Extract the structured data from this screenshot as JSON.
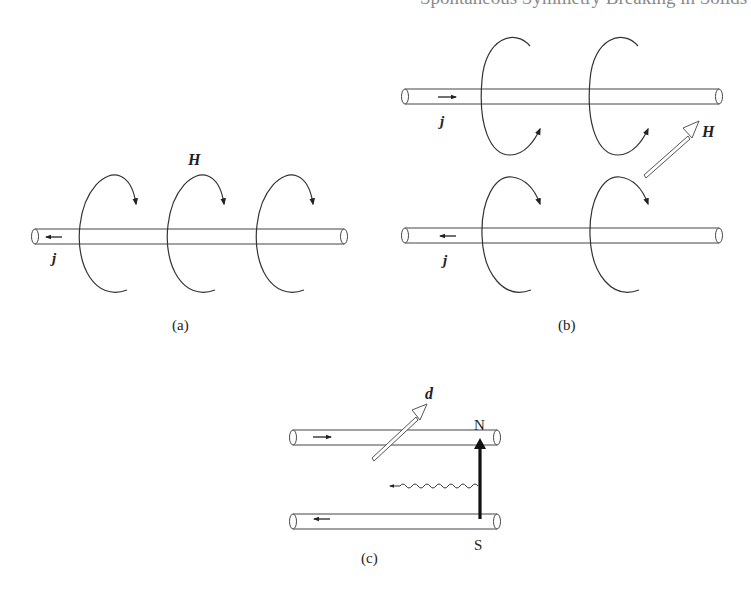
{
  "header": {
    "clipped_text": "Spontaneous Symmetry Breaking in Solids"
  },
  "panels": {
    "a": {
      "caption": "(a)",
      "current_label": "j",
      "field_label": "H",
      "current_direction": "left"
    },
    "b": {
      "caption": "(b)",
      "top_current_label": "j",
      "bottom_current_label": "j",
      "field_label": "H",
      "top_current_direction": "right",
      "bottom_current_direction": "left"
    },
    "c": {
      "caption": "(c)",
      "dipole_label": "d",
      "north_label": "N",
      "south_label": "S"
    }
  },
  "colors": {
    "line": "#333333",
    "background": "#ffffff"
  }
}
